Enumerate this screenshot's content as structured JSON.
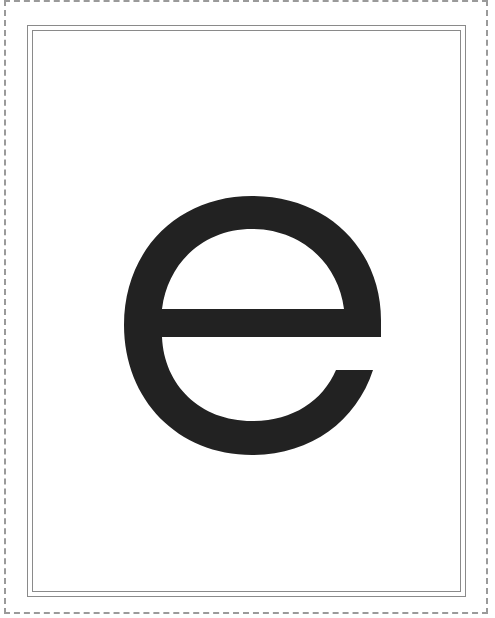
{
  "card": {
    "letter": "e",
    "letter_color": "#222222",
    "frame_color": "#8a8a8a",
    "cut_line_color": "#9a9a9a",
    "background": "#ffffff"
  }
}
